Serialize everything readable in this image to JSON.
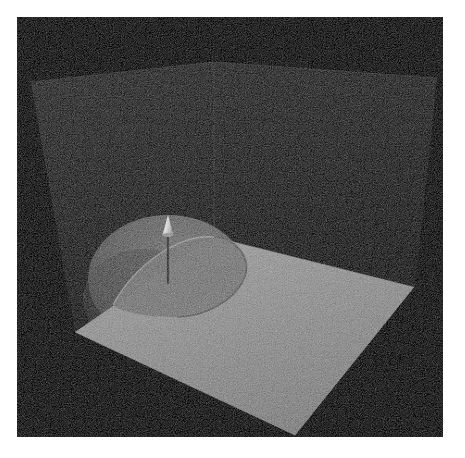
{
  "viewport": {
    "width": 465,
    "height": 458,
    "page_background": "#ffffff",
    "canvas_background": "#050505",
    "canvas_rect": {
      "x": 17,
      "y": 17,
      "width": 426,
      "height": 420
    },
    "render_style": "monochrome path-traced render with sampling noise",
    "label": "3D render viewport"
  },
  "scene": {
    "name": "hemisphere-on-ground-plane-with-normal-vector",
    "description": "A grey hemisphere (dome) resting on a light grey ground plane inside a dark two-walled corner backdrop, with a single light-coloured arrow (surface normal) rising from the dome apex.",
    "objects": [
      {
        "name": "back-wall-left",
        "type": "plane",
        "fill": "#1a1a1a",
        "points": "14,65 197,45 197,220 58,315"
      },
      {
        "name": "back-wall-right",
        "type": "plane",
        "fill": "#161616",
        "points": "197,45 420,61 398,270 197,220"
      },
      {
        "name": "wall-corner-edge",
        "type": "edge",
        "stroke": "#2a2a2a",
        "points": "197,45 197,220"
      },
      {
        "name": "ground-plane",
        "type": "plane",
        "fill": "#8c8c8c",
        "points": "58,315 197,220 397,270 278,418"
      },
      {
        "name": "dome",
        "type": "hemisphere",
        "fill": "#5a5a5a",
        "center_x": 151,
        "center_y": 262,
        "radius_x": 80,
        "radius_y": 64,
        "apex_x": 151,
        "apex_y": 198
      },
      {
        "name": "normal-arrow",
        "type": "arrow",
        "fill": "#d8d8d8",
        "shaft_stroke": "#2e2e2e",
        "tail_x": 151,
        "tail_y": 266,
        "tip_x": 151,
        "tip_y": 198,
        "head_length": 20,
        "head_width": 11
      }
    ],
    "colors": {
      "background": "#050505",
      "wall_left": "#1a1a1a",
      "wall_right": "#161616",
      "ground": "#8c8c8c",
      "dome": "#5a5a5a",
      "arrow_head": "#d8d8d8",
      "arrow_shaft": "#2e2e2e",
      "page": "#ffffff"
    }
  }
}
